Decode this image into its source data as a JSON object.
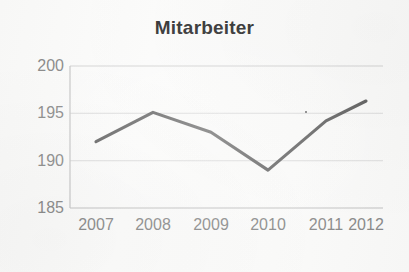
{
  "chart_data": {
    "type": "line",
    "title": "Mitarbeiter",
    "xlabel": "",
    "ylabel": "",
    "categories": [
      "2007",
      "2008",
      "2009",
      "2010",
      "2011",
      "2012"
    ],
    "values": [
      192,
      195.1,
      193,
      189,
      194.2,
      196.3
    ],
    "series": [
      {
        "name": "Mitarbeiter",
        "values": [
          192,
          195.1,
          193,
          189,
          194.2,
          196.3
        ]
      }
    ],
    "ylim": [
      185,
      200
    ],
    "yticks": [
      185,
      190,
      195,
      200
    ],
    "ytick_labels": [
      "185",
      "190",
      "195",
      "200"
    ],
    "xtick_labels": [
      "2007",
      "2008",
      "2009",
      "2010",
      "2011",
      "2012"
    ],
    "grid": true,
    "grid_axis": "y",
    "legend": false,
    "legend_position": "none",
    "line_color": "#4f4f4f",
    "grid_color": "#d6d6d6",
    "axis_color": "#c9c9c9",
    "tick_label_color": "#8a8a8a",
    "title_color": "#333333",
    "background_color": "#fafaf9",
    "annotations": [
      {
        "name": "scan-speck",
        "x": "2011",
        "y": 195.1
      }
    ]
  }
}
